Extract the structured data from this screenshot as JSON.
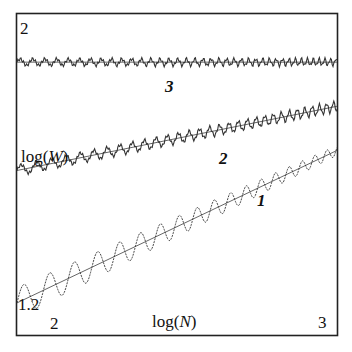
{
  "chart_data": {
    "type": "line",
    "title": "",
    "xlabel": "log(N)",
    "ylabel": "log(W)",
    "xlim": [
      2,
      3
    ],
    "ylim": [
      1.2,
      2
    ],
    "x_ticks": [
      "2",
      "3"
    ],
    "y_ticks": [
      "1.2",
      "2"
    ],
    "grid": false,
    "legend": "none (curves labeled inline)",
    "series": [
      {
        "name": "1",
        "description": "oscillating data (dotted/thin) with straight-line fit; largest slope, strong oscillations decaying with N",
        "fit_line": {
          "x": [
            2.0,
            3.0
          ],
          "y": [
            1.28,
            1.66
          ]
        },
        "oscillation_amplitude": "large at small N, decreasing toward large N"
      },
      {
        "name": "2",
        "description": "oscillating data with fit line; moderate slope",
        "fit_line": {
          "x": [
            2.0,
            3.0
          ],
          "y": [
            1.61,
            1.77
          ]
        },
        "oscillation_amplitude": "small"
      },
      {
        "name": "3",
        "description": "nearly flat data with fit line",
        "fit_line": {
          "x": [
            2.0,
            3.0
          ],
          "y": [
            1.88,
            1.88
          ]
        },
        "oscillation_amplitude": "small"
      }
    ]
  },
  "labels": {
    "y_top": "2",
    "y_bottom": "1.2",
    "x_left": "2",
    "x_right": "3",
    "xlabel_prefix": "log(",
    "xlabel_var": "N",
    "xlabel_suffix": ")",
    "ylabel_prefix": "log(",
    "ylabel_var": "W",
    "ylabel_suffix": ")",
    "curve1": "1",
    "curve2": "2",
    "curve3": "3"
  },
  "colors": {
    "axes": "#222222",
    "fit_line": "#555555",
    "data": "#333333",
    "background": "#ffffff"
  }
}
